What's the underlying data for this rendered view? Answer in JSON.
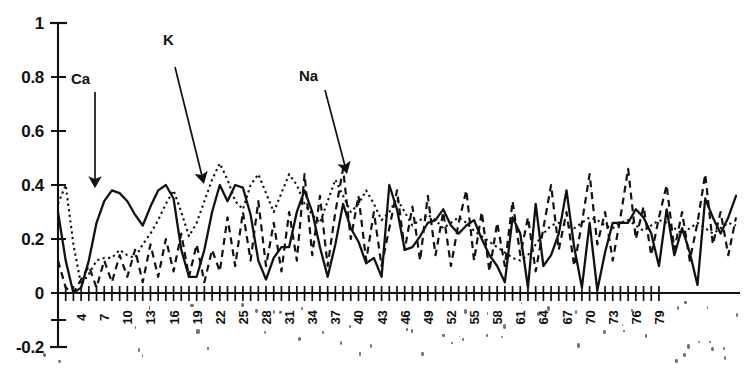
{
  "chart_data": {
    "type": "line",
    "title": "",
    "xlabel": "",
    "ylabel": "",
    "ylim": [
      -0.2,
      1
    ],
    "xlim": [
      1,
      79
    ],
    "grid": false,
    "legend": "none (inline arrow annotations)",
    "y_ticks": [
      "1",
      "0.8",
      "0.6",
      "0.4",
      "0.2",
      "0",
      "-0.2"
    ],
    "y_tick_values": [
      1,
      0.8,
      0.6,
      0.4,
      0.2,
      0,
      -0.2
    ],
    "x_tick_labels": [
      "4",
      "7",
      "10",
      "13",
      "16",
      "19",
      "22",
      "25",
      "28",
      "31",
      "34",
      "37",
      "40",
      "43",
      "46",
      "49",
      "52",
      "55",
      "58",
      "61",
      "64",
      "67",
      "70",
      "73",
      "76",
      "79"
    ],
    "x_tick_label_interval": 3,
    "x_tick_count": 79,
    "annotations": [
      {
        "text": "Ca",
        "points_to_series": "Ca",
        "x_label": 77,
        "y_label": 78,
        "arrow": "vertical-down",
        "tip_x": 95,
        "tip_y": 182
      },
      {
        "text": "K",
        "points_to_series": "K",
        "x_label": 168,
        "y_label": 38,
        "arrow": "diagonal-down-right",
        "tip_x": 203,
        "tip_y": 178
      },
      {
        "text": "Na",
        "points_to_series": "Na",
        "x_label": 305,
        "y_label": 74,
        "arrow": "diagonal-down-right",
        "tip_x": 345,
        "tip_y": 168
      }
    ],
    "series": [
      {
        "name": "Ca",
        "style": "solid",
        "color": "#111111",
        "values": [
          0.3,
          0.12,
          0.0,
          0.02,
          0.12,
          0.26,
          0.34,
          0.38,
          0.37,
          0.34,
          0.29,
          0.25,
          0.32,
          0.38,
          0.4,
          0.35,
          0.16,
          0.06,
          0.06,
          0.16,
          0.3,
          0.4,
          0.34,
          0.4,
          0.39,
          0.29,
          0.12,
          0.05,
          0.13,
          0.17,
          0.17,
          0.3,
          0.38,
          0.3,
          0.17,
          0.06,
          0.18,
          0.33,
          0.24,
          0.19,
          0.11,
          0.13,
          0.06,
          0.4,
          0.31,
          0.16,
          0.17,
          0.21,
          0.26,
          0.27,
          0.31,
          0.25,
          0.22,
          0.25,
          0.27,
          0.2,
          0.14,
          0.1,
          0.04,
          0.28,
          0.22,
          0.02,
          0.33,
          0.1,
          0.14,
          0.22,
          0.38,
          0.17,
          0.02,
          0.26,
          0.01,
          0.15,
          0.26,
          0.26,
          0.26,
          0.31,
          0.28,
          0.22,
          0.1,
          0.31,
          0.14,
          0.24,
          0.15,
          0.03,
          0.35,
          0.28,
          0.22,
          0.28,
          0.36
        ]
      },
      {
        "name": "K",
        "style": "fine-dotted",
        "color": "#111111",
        "values": [
          0.33,
          0.4,
          0.18,
          0.03,
          0.07,
          0.12,
          0.13,
          0.13,
          0.16,
          0.14,
          0.13,
          0.18,
          0.22,
          0.27,
          0.33,
          0.38,
          0.3,
          0.21,
          0.26,
          0.34,
          0.42,
          0.48,
          0.42,
          0.34,
          0.31,
          0.4,
          0.44,
          0.37,
          0.3,
          0.37,
          0.44,
          0.4,
          0.33,
          0.29,
          0.26,
          0.34,
          0.42,
          0.36,
          0.3,
          0.33,
          0.38,
          0.33,
          0.27,
          0.3,
          0.35,
          0.3,
          0.25,
          0.27,
          0.29,
          0.27,
          0.24,
          0.26,
          0.28,
          0.26,
          0.23,
          0.21,
          0.19,
          0.17,
          0.15,
          0.13,
          0.12,
          0.14,
          0.18,
          0.22,
          0.25,
          0.26,
          0.25,
          0.24,
          0.26,
          0.28,
          0.27,
          0.25,
          0.24,
          0.26,
          0.27,
          0.25,
          0.23,
          0.25,
          0.27,
          0.26,
          0.24,
          0.22,
          0.24,
          0.26,
          0.24,
          0.22,
          0.24,
          0.26,
          0.25
        ]
      },
      {
        "name": "Na",
        "style": "coarse-dashed",
        "color": "#111111",
        "values": [
          0.12,
          0.02,
          0.0,
          0.05,
          0.1,
          0.02,
          0.12,
          0.04,
          0.14,
          0.06,
          0.16,
          0.04,
          0.18,
          0.06,
          0.2,
          0.08,
          0.22,
          0.06,
          0.18,
          0.04,
          0.16,
          0.08,
          0.28,
          0.1,
          0.3,
          0.12,
          0.34,
          0.1,
          0.26,
          0.08,
          0.3,
          0.12,
          0.44,
          0.14,
          0.36,
          0.1,
          0.3,
          0.46,
          0.2,
          0.36,
          0.12,
          0.3,
          0.1,
          0.24,
          0.38,
          0.16,
          0.32,
          0.12,
          0.36,
          0.14,
          0.3,
          0.1,
          0.26,
          0.38,
          0.12,
          0.3,
          0.08,
          0.26,
          0.1,
          0.34,
          0.14,
          0.28,
          0.08,
          0.24,
          0.4,
          0.16,
          0.3,
          0.1,
          0.26,
          0.44,
          0.18,
          0.3,
          0.12,
          0.28,
          0.46,
          0.2,
          0.32,
          0.14,
          0.28,
          0.4,
          0.16,
          0.3,
          0.12,
          0.26,
          0.44,
          0.18,
          0.3,
          0.14,
          0.28
        ]
      }
    ]
  }
}
